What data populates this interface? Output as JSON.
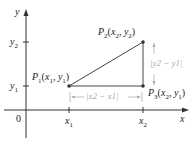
{
  "diagram": {
    "type": "distance-between-points",
    "axes": {
      "x_label": "x",
      "y_label": "y",
      "origin_label": "0",
      "x_ticks": [
        "x1",
        "x2"
      ],
      "y_ticks": [
        "y1",
        "y2"
      ]
    },
    "labels": {
      "y_axis": "y",
      "x_axis": "x",
      "origin": "0",
      "x1_tick": "x",
      "x1_sub": "1",
      "x2_tick": "x",
      "x2_sub": "2",
      "y1_tick": "y",
      "y1_sub": "1",
      "y2_tick": "y",
      "y2_sub": "2"
    },
    "points": [
      {
        "name": "P1",
        "text": "P",
        "sub": "1",
        "coords": "(x1, y1)"
      },
      {
        "name": "P2",
        "text": "P",
        "sub": "2",
        "coords": "(x2, y2)"
      },
      {
        "name": "P3",
        "text": "P",
        "sub": "3",
        "coords": "(x2, y1)"
      }
    ],
    "dimensions": {
      "horizontal": "|x2 − x1|",
      "vertical": "|y2 − y1|"
    },
    "colors": {
      "axis": "#333333",
      "segment": "#444444",
      "dimension": "#b0b0b0",
      "point": "#333333"
    }
  }
}
